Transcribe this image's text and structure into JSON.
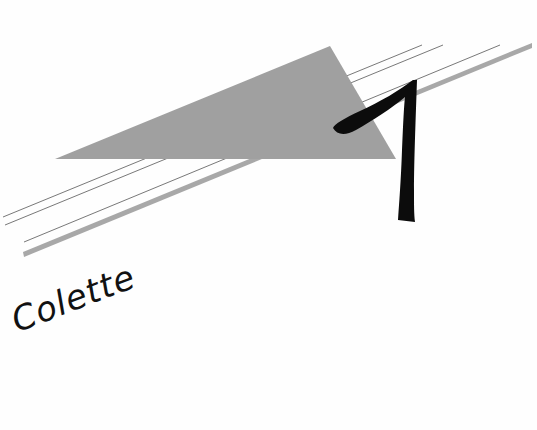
{
  "page": {
    "chapter_number": "1",
    "author": "Colette"
  },
  "colors": {
    "background": "#fefefe",
    "triangle": "#a0a0a0",
    "stripe": "#a8a8a8",
    "line": "#555555",
    "numeral": "#0c0c0c"
  }
}
